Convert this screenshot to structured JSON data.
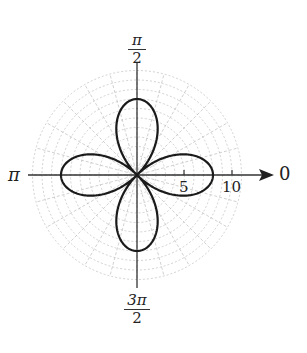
{
  "chart_data": {
    "type": "line",
    "subtype": "polar",
    "title": "",
    "curve": "four-leaved rose r = 8 cos(2θ)",
    "r_max": 8,
    "petals": 4,
    "petal_directions": [
      "0",
      "π/2",
      "π",
      "3π/2"
    ],
    "angle_labels": {
      "right": "0",
      "top": {
        "num": "π",
        "den": "2"
      },
      "left": "π",
      "bottom": {
        "num": "3π",
        "den": "2"
      }
    },
    "radial_ticks": [
      5,
      10
    ],
    "radial_tick_labels": [
      "5",
      "10"
    ],
    "grid": {
      "on": true,
      "style": "dashed light gray polar grid",
      "r_extent": 11
    },
    "axis_range_r": [
      0,
      11
    ]
  },
  "labels": {
    "zero": "0",
    "pi": "π",
    "half_pi_num": "π",
    "half_pi_den": "2",
    "three_half_pi_num": "3π",
    "three_half_pi_den": "2",
    "tick5": "5",
    "tick10": "10"
  },
  "colors": {
    "curve": "#1a1a1a",
    "axis": "#333333",
    "grid": "#b8b8b8"
  }
}
